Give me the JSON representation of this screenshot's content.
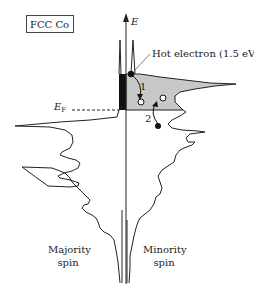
{
  "figure": {
    "title": "FCC Co",
    "axis_label": "E",
    "fermi_label_main": "E",
    "fermi_label_sub": "F",
    "hot_electron_label": "Hot electron (1.5 eV)",
    "process_1_label": "1",
    "process_2_label": "2",
    "majority_label_line1": "Majority",
    "majority_label_line2": "spin",
    "minority_label_line1": "Minority",
    "minority_label_line2": "spin"
  },
  "colors": {
    "line": "#222222",
    "shaded_region": "#c8c8c8",
    "majority_filled_block": "#111111",
    "background": "#ffffff"
  }
}
